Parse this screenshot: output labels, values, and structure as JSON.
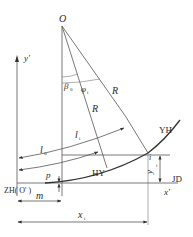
{
  "diagram": {
    "labels": {
      "center": "O",
      "y_axis": "y'",
      "x_axis": "x'",
      "beta0": "β",
      "beta0_sub": "0",
      "phi": "φ",
      "phi_sub": "i",
      "radius_outer": "R",
      "radius_inner": "R",
      "li": "l",
      "li_sub": "i",
      "l0": "l",
      "l0_sub": "0",
      "yh": "YH",
      "hy": "HY",
      "point_i": "i",
      "yi": "y",
      "yi_sub": "i",
      "jd": "JD",
      "p": "p",
      "zh": "ZH( O' )",
      "m": "m",
      "xi": "x",
      "xi_sub": "i"
    },
    "colors": {
      "line": "#555555",
      "curve": "#333333",
      "text": "#2a2a2a",
      "background": "#ffffff"
    }
  }
}
